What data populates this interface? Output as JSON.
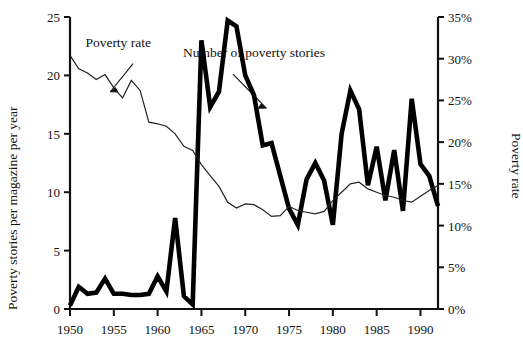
{
  "chart_data": {
    "type": "line",
    "title": "",
    "xlabel": "",
    "ylabel": "Poverty stories per magazine per year",
    "y2label": "Poverty rate",
    "xlim": [
      1950,
      1992
    ],
    "ylim": [
      0,
      25
    ],
    "y2lim": [
      0,
      35
    ],
    "grid": false,
    "legend_position": "inline-annotations",
    "xticks": [
      1950,
      1955,
      1960,
      1965,
      1970,
      1975,
      1980,
      1985,
      1990
    ],
    "xticklabels": [
      "1950",
      "1955",
      "1960",
      "1965",
      "1970",
      "1975",
      "1980",
      "1985",
      "1990"
    ],
    "yticks": [
      0,
      5,
      10,
      15,
      20,
      25
    ],
    "yticklabels": [
      "0",
      "5",
      "10",
      "15",
      "20",
      "25"
    ],
    "y2ticks": [
      0,
      5,
      10,
      15,
      20,
      25,
      30,
      35
    ],
    "y2ticklabels": [
      "0%",
      "5%",
      "10%",
      "15%",
      "20%",
      "25%",
      "30%",
      "35%"
    ],
    "annotations": [
      {
        "text": "Poverty rate",
        "x": 1955.5,
        "y": 22.4
      },
      {
        "text": "Number of poverty stories",
        "x": 1971.0,
        "y": 21.6
      }
    ],
    "series": [
      {
        "name": "Number of poverty stories",
        "axis": "left",
        "style": "thick",
        "color": "#000000",
        "x": [
          1950,
          1951,
          1952,
          1953,
          1954,
          1955,
          1956,
          1957,
          1958,
          1959,
          1960,
          1961,
          1962,
          1963,
          1964,
          1965,
          1966,
          1967,
          1968,
          1969,
          1970,
          1971,
          1972,
          1973,
          1974,
          1975,
          1976,
          1977,
          1978,
          1979,
          1980,
          1981,
          1982,
          1983,
          1984,
          1985,
          1986,
          1987,
          1988,
          1989,
          1990,
          1991,
          1992
        ],
        "values": [
          0.3,
          1.9,
          1.3,
          1.4,
          2.6,
          1.3,
          1.3,
          1.2,
          1.2,
          1.3,
          2.8,
          1.5,
          7.8,
          1.1,
          0.4,
          23.0,
          17.3,
          18.6,
          24.7,
          24.2,
          20.0,
          18.3,
          14.0,
          14.2,
          11.4,
          8.6,
          7.2,
          11.1,
          12.5,
          11.0,
          7.2,
          15.0,
          18.7,
          17.1,
          10.6,
          13.9,
          9.3,
          13.6,
          8.4,
          18.0,
          12.4,
          11.4,
          8.8
        ]
      },
      {
        "name": "Poverty rate",
        "axis": "right",
        "style": "thin",
        "color": "#222222",
        "x": [
          1950,
          1951,
          1952,
          1953,
          1954,
          1955,
          1956,
          1957,
          1958,
          1959,
          1960,
          1961,
          1962,
          1963,
          1964,
          1965,
          1966,
          1967,
          1968,
          1969,
          1970,
          1971,
          1972,
          1973,
          1974,
          1975,
          1976,
          1977,
          1978,
          1979,
          1980,
          1981,
          1982,
          1983,
          1984,
          1985,
          1986,
          1987,
          1988,
          1989,
          1990,
          1991,
          1992
        ],
        "values": [
          30.4,
          28.8,
          28.3,
          27.5,
          28.1,
          26.5,
          25.3,
          27.4,
          26.2,
          22.4,
          22.2,
          21.9,
          21.0,
          19.5,
          19.0,
          17.3,
          16.0,
          14.7,
          12.8,
          12.1,
          12.6,
          12.5,
          11.9,
          11.1,
          11.2,
          12.3,
          11.8,
          11.6,
          11.4,
          11.7,
          13.0,
          14.0,
          15.0,
          15.2,
          14.4,
          14.0,
          13.6,
          13.4,
          13.0,
          12.8,
          13.5,
          14.2,
          14.8
        ]
      }
    ]
  },
  "axes": {
    "left_title": "Poverty stories per magazine per year",
    "right_title": "Poverty rate"
  }
}
